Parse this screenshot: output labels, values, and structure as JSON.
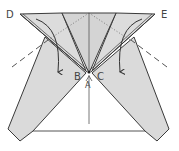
{
  "diagram": {
    "type": "origami-fold-step",
    "labels": {
      "D": "D",
      "E": "E",
      "A": "A",
      "B": "B",
      "C": "C"
    },
    "colors": {
      "paper": "#d9d9d9",
      "paper_light": "#e4e4e4",
      "outline": "#3a3a3a",
      "dashed": "#555555",
      "arrow": "#333333",
      "background": "#ffffff"
    },
    "arrows": [
      {
        "name": "fold-arrow-left",
        "from": "D",
        "direction": "down"
      },
      {
        "name": "fold-arrow-right",
        "from": "E",
        "direction": "down"
      }
    ]
  }
}
